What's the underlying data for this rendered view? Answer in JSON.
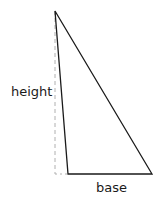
{
  "diagram": {
    "type": "triangle-area",
    "labels": {
      "height": "height",
      "base": "base"
    },
    "colors": {
      "stroke": "#1a1a1a",
      "dashed": "#b0b0b0",
      "background": "#ffffff"
    },
    "vertices": {
      "apex": [
        55,
        11
      ],
      "bottom_left": [
        68,
        174
      ],
      "bottom_right": [
        152,
        174
      ]
    },
    "height_line": {
      "x": 55,
      "y1": 11,
      "y2": 174,
      "style": "dashed"
    }
  }
}
